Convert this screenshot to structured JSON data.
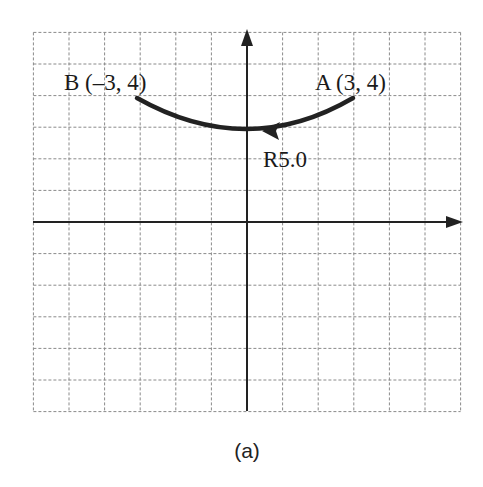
{
  "figure": {
    "caption": "(a)",
    "grid": {
      "x_min": -6,
      "x_max": 6,
      "y_min": -6,
      "y_max": 6,
      "origin_px": [
        247,
        222
      ],
      "unit_x_px": 35.6,
      "unit_y_px": 31.6,
      "line_color": "#8a8a8a",
      "axis_color": "#222222"
    },
    "points": [
      {
        "name": "A",
        "x": 3,
        "y": 4,
        "label": "A (3, 4)"
      },
      {
        "name": "B",
        "x": -3,
        "y": 4,
        "label": "B (–3, 4)"
      }
    ],
    "arc": {
      "from": "A",
      "to": "B",
      "direction": "A to B",
      "radius_label": "R5.0",
      "stroke_color": "#222222"
    }
  }
}
